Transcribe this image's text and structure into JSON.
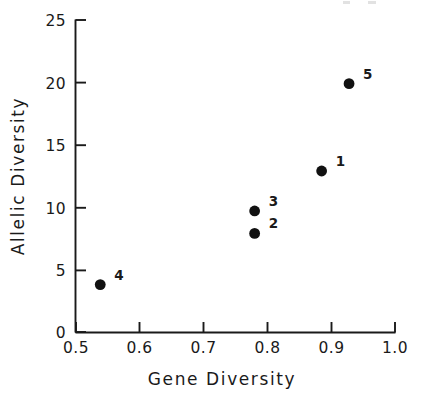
{
  "chart_data": {
    "type": "scatter",
    "title": "",
    "xlabel": "Gene Diversity",
    "ylabel": "Allelic Diversity",
    "xlim": [
      0.5,
      1.0
    ],
    "ylim": [
      0,
      25
    ],
    "grid": false,
    "legend": "none",
    "xticks": [
      "0.5",
      "0.6",
      "0.7",
      "0.8",
      "0.9",
      "1.0"
    ],
    "xtick_values": [
      0.5,
      0.6,
      0.7,
      0.8,
      0.9,
      1.0
    ],
    "yticks": [
      "0",
      "5",
      "10",
      "15",
      "20",
      "25"
    ],
    "ytick_values": [
      0,
      5,
      10,
      15,
      20,
      25
    ],
    "marker": "filled-circle",
    "marker_color": "#111111",
    "points": [
      {
        "label": "1",
        "x": 0.885,
        "y": 12.9
      },
      {
        "label": "2",
        "x": 0.78,
        "y": 7.9
      },
      {
        "label": "3",
        "x": 0.78,
        "y": 9.7
      },
      {
        "label": "4",
        "x": 0.538,
        "y": 3.8
      },
      {
        "label": "5",
        "x": 0.928,
        "y": 19.9
      }
    ]
  },
  "axes": {
    "x_title": "Gene Diversity",
    "y_title": "Allelic Diversity"
  },
  "colors": {
    "marker": "#111111",
    "axis": "#1a1a1a",
    "background": "#ffffff"
  }
}
